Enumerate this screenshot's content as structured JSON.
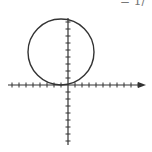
{
  "corner_text": "= 1/",
  "colors": {
    "stroke": "#333333",
    "background": "#ffffff"
  },
  "chart_data": {
    "type": "line",
    "title": "",
    "xlabel": "",
    "ylabel": "",
    "tick_labels": [],
    "grid": false,
    "legend": null,
    "axes": {
      "origin_px": [
        68,
        85
      ],
      "tick_spacing_px": 7,
      "x_ticks_left": 8,
      "x_ticks_right": 10,
      "y_ticks_up": 9,
      "y_ticks_down": 8,
      "x_arrow": true
    },
    "series": [
      {
        "name": "circle",
        "center_units": [
          -1,
          4.7
        ],
        "radius_units": 4.7,
        "center_px": [
          61,
          52
        ],
        "radius_px": 33
      }
    ],
    "xlim": [
      -9,
      10
    ],
    "ylim": [
      -8,
      9
    ]
  }
}
